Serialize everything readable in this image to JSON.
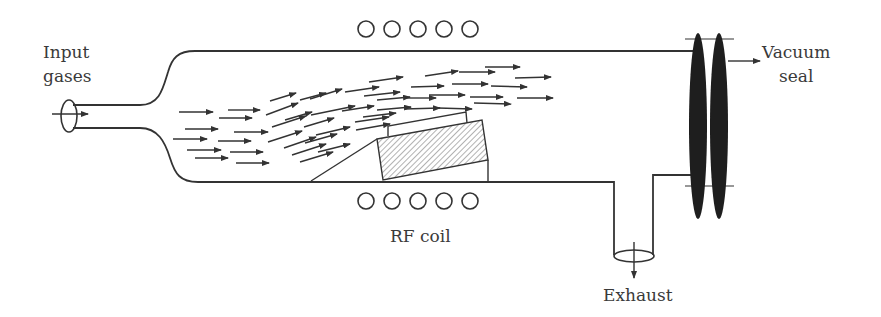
{
  "labels": {
    "input_gases": [
      "Input",
      "gases"
    ],
    "vacuum_seal": [
      "Vacuum",
      "seal"
    ],
    "rf_coil": "RF coil",
    "exhaust": "Exhaust"
  },
  "colors": {
    "line": "#333333",
    "seal_fill": "#1e1e1e",
    "text": "#3a3a3a"
  },
  "rf_coil_turns_per_side": 5,
  "components": [
    "input port",
    "quartz tube",
    "gas flow arrows",
    "substrate holder (susceptor)",
    "wafer",
    "RF coil (top)",
    "RF coil (bottom)",
    "exhaust port",
    "vacuum seal flanges"
  ]
}
